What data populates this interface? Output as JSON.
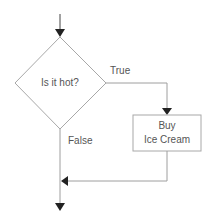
{
  "diagram": {
    "type": "flowchart",
    "decision": {
      "label": "Is it hot?"
    },
    "process": {
      "line1": "Buy",
      "line2": "Ice Cream"
    },
    "edges": {
      "true_label": "True",
      "false_label": "False"
    },
    "colors": {
      "stroke": "#9e9e9e",
      "arrow": "#222222",
      "text": "#555555"
    }
  }
}
